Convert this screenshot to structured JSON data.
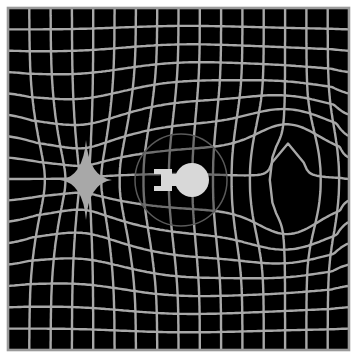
{
  "diagram": {
    "background_color": "#000000",
    "grid_color": "#a8a8a8",
    "frame_color": "#9a9a9a",
    "page_color": "#ffffff",
    "grid": {
      "left": 8,
      "top": 8,
      "right": 349,
      "bottom": 350,
      "columns": 16,
      "rows": 16,
      "line_width": 2.4
    },
    "ship": {
      "label": "",
      "center_x": 181,
      "center_y": 180,
      "bubble_radius": 46,
      "saucer_radius": 17,
      "color": "#d8d8d8"
    },
    "contraction_region": {
      "label": "",
      "center_x": 86,
      "center_y": 180
    },
    "expansion_region": {
      "label": "",
      "center_x": 288,
      "center_y": 180
    }
  }
}
